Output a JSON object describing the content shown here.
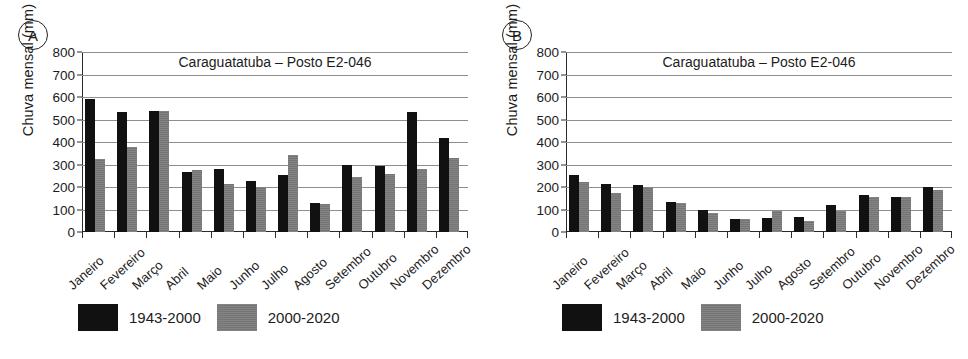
{
  "figure": {
    "panels": [
      {
        "letter": "A",
        "title": "Caraguatatuba – Posto E2-046",
        "ylabel": "Chuva mensal (mm)",
        "chart_data": {
          "type": "bar",
          "title": "Caraguatatuba – Posto E2-046",
          "xlabel": "",
          "ylabel": "Chuva mensal (mm)",
          "ylim": [
            0,
            800
          ],
          "yticks": [
            0,
            100,
            200,
            300,
            400,
            500,
            600,
            700,
            800
          ],
          "grid": true,
          "legend_position": "below",
          "categories": [
            "Janeiro",
            "Fevereiro",
            "Março",
            "Abril",
            "Maio",
            "Junho",
            "Julho",
            "Agosto",
            "Setembro",
            "Outubro",
            "Novembro",
            "Dezembro"
          ],
          "series": [
            {
              "name": "1943-2000",
              "color": "#111111",
              "values": [
                590,
                533,
                540,
                268,
                278,
                228,
                253,
                127,
                298,
                294,
                533,
                418
              ]
            },
            {
              "name": "2000-2020",
              "color": "#7b7b7b",
              "values": [
                325,
                380,
                540,
                277,
                215,
                200,
                343,
                124,
                246,
                258,
                280,
                331
              ]
            }
          ]
        },
        "legend": [
          {
            "label": "1943-2000",
            "color": "#111111",
            "swatch": "black"
          },
          {
            "label": "2000-2020",
            "color": "#7b7b7b",
            "swatch": "gray"
          }
        ]
      },
      {
        "letter": "B",
        "title": "Caraguatatuba – Posto E2-046",
        "ylabel": "Chuva mensal (mm)",
        "chart_data": {
          "type": "bar",
          "title": "Caraguatatuba – Posto E2-046",
          "xlabel": "",
          "ylabel": "Chuva mensal (mm)",
          "ylim": [
            0,
            800
          ],
          "yticks": [
            0,
            100,
            200,
            300,
            400,
            500,
            600,
            700,
            800
          ],
          "grid": true,
          "legend_position": "below",
          "categories": [
            "Janeiro",
            "Fevereiro",
            "Março",
            "Abril",
            "Maio",
            "Junho",
            "Julho",
            "Agosto",
            "Setembro",
            "Outubro",
            "Novembro",
            "Dezembro"
          ],
          "series": [
            {
              "name": "1943-2000",
              "color": "#111111",
              "values": [
                252,
                212,
                208,
                135,
                100,
                60,
                63,
                66,
                118,
                163,
                155,
                200
              ]
            },
            {
              "name": "2000-2020",
              "color": "#7b7b7b",
              "values": [
                222,
                175,
                200,
                130,
                83,
                60,
                92,
                50,
                95,
                155,
                155,
                185
              ]
            }
          ]
        },
        "legend": [
          {
            "label": "1943-2000",
            "color": "#111111",
            "swatch": "black"
          },
          {
            "label": "2000-2020",
            "color": "#7b7b7b",
            "swatch": "gray"
          }
        ]
      }
    ]
  }
}
